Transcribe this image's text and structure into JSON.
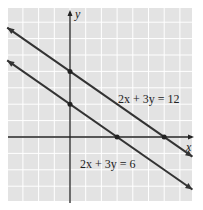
{
  "chart_data": {
    "type": "line",
    "title": "",
    "xlabel": "x",
    "ylabel": "y",
    "grid": true,
    "xlim": [
      -4,
      8
    ],
    "ylim": [
      -4,
      8
    ],
    "series": [
      {
        "name": "2x + 3y = 12",
        "equation": "2x + 3y = 12",
        "intercepts": {
          "x": 6,
          "y": 4
        },
        "points": [
          [
            -4,
            6.67
          ],
          [
            7.8,
            -1.2
          ]
        ]
      },
      {
        "name": "2x + 3y = 6",
        "equation": "2x + 3y = 6",
        "intercepts": {
          "x": 3,
          "y": 2
        },
        "points": [
          [
            -4,
            4.67
          ],
          [
            7.8,
            -3.2
          ]
        ]
      }
    ],
    "marked_points": [
      [
        0,
        4
      ],
      [
        6,
        0
      ],
      [
        0,
        2
      ],
      [
        3,
        0
      ]
    ]
  },
  "labels": {
    "x_axis": "x",
    "y_axis": "y",
    "line1": "2x + 3y = 12",
    "line2": "2x + 3y = 6"
  },
  "colors": {
    "grid_bg": "#e3e3e3",
    "grid_line": "#ffffff",
    "line": "#333333"
  }
}
